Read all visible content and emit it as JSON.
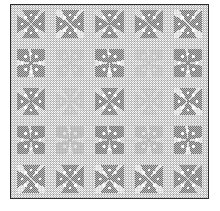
{
  "image": {
    "title": "Dithered grayscale quilt pattern",
    "description": "Halftone-screened black-and-white quilt block pattern: a five-by-five grid of X and plus shaped star blocks on a fine checkerboard ground, enclosed by a thin dark rectangular border with a white page margin.",
    "medium": "1-bit dithered / halftone screened bitmap",
    "palette": {
      "page": "#ffffff",
      "border": "#2b2b2b",
      "ground_light": "#ffffff",
      "ground_dark": "#b9b9b9",
      "motif_dark": "#6e6e6e",
      "motif_highlight": "#ffffff"
    },
    "frame": {
      "left": 10,
      "top": 4,
      "width": 199,
      "height": 195,
      "border_width": 1
    },
    "grid": {
      "rows": 5,
      "columns": 5,
      "motif_names": [
        "x-star-block",
        "plus-star-block"
      ]
    },
    "tiles": [
      [
        {
          "motif": "motif-x",
          "fade": "fade-0"
        },
        {
          "motif": "motif-x",
          "fade": "fade-0"
        },
        {
          "motif": "motif-x",
          "fade": "fade-0"
        },
        {
          "motif": "motif-x",
          "fade": "fade-0"
        },
        {
          "motif": "motif-x",
          "fade": "fade-0"
        }
      ],
      [
        {
          "motif": "motif-plus",
          "fade": "fade-0"
        },
        {
          "motif": "motif-plus",
          "fade": "fade-3"
        },
        {
          "motif": "motif-plus",
          "fade": "fade-0"
        },
        {
          "motif": "motif-plus",
          "fade": "fade-3"
        },
        {
          "motif": "motif-plus",
          "fade": "fade-0"
        }
      ],
      [
        {
          "motif": "motif-x",
          "fade": "fade-0"
        },
        {
          "motif": "motif-x",
          "fade": "fade-3"
        },
        {
          "motif": "motif-x",
          "fade": "fade-0"
        },
        {
          "motif": "motif-x",
          "fade": "fade-3"
        },
        {
          "motif": "motif-x",
          "fade": "fade-0"
        }
      ],
      [
        {
          "motif": "motif-plus",
          "fade": "fade-0"
        },
        {
          "motif": "motif-plus",
          "fade": "fade-2"
        },
        {
          "motif": "motif-plus",
          "fade": "fade-0"
        },
        {
          "motif": "motif-plus",
          "fade": "fade-2"
        },
        {
          "motif": "motif-plus",
          "fade": "fade-0"
        }
      ],
      [
        {
          "motif": "motif-x",
          "fade": "fade-0"
        },
        {
          "motif": "motif-x",
          "fade": "fade-0"
        },
        {
          "motif": "motif-x",
          "fade": "fade-0"
        },
        {
          "motif": "motif-x",
          "fade": "fade-0"
        },
        {
          "motif": "motif-x",
          "fade": "fade-0"
        }
      ]
    ]
  }
}
